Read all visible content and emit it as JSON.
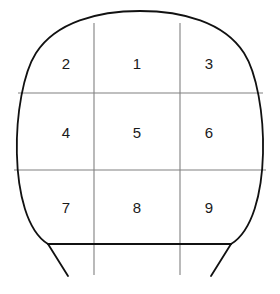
{
  "figure": {
    "shape_name": "dome-outline",
    "background_color": "#ffffff",
    "outline_color": "#111111",
    "grid_color": "#808080",
    "text_color": "#1a1a1a"
  },
  "grid": {
    "rows": 3,
    "columns": 3,
    "cells": [
      {
        "id": "cell-r1c1",
        "label": "2",
        "row": 1,
        "col": 1,
        "x": 66,
        "y": 63
      },
      {
        "id": "cell-r1c2",
        "label": "1",
        "row": 1,
        "col": 2,
        "x": 137,
        "y": 63
      },
      {
        "id": "cell-r1c3",
        "label": "3",
        "row": 1,
        "col": 3,
        "x": 209,
        "y": 63
      },
      {
        "id": "cell-r2c1",
        "label": "4",
        "row": 2,
        "col": 1,
        "x": 66,
        "y": 132
      },
      {
        "id": "cell-r2c2",
        "label": "5",
        "row": 2,
        "col": 2,
        "x": 137,
        "y": 132
      },
      {
        "id": "cell-r2c3",
        "label": "6",
        "row": 2,
        "col": 3,
        "x": 209,
        "y": 132
      },
      {
        "id": "cell-r3c1",
        "label": "7",
        "row": 3,
        "col": 1,
        "x": 66,
        "y": 207
      },
      {
        "id": "cell-r3c2",
        "label": "8",
        "row": 3,
        "col": 2,
        "x": 137,
        "y": 207
      },
      {
        "id": "cell-r3c3",
        "label": "9",
        "row": 3,
        "col": 3,
        "x": 209,
        "y": 207
      }
    ],
    "vertical_lines": [
      {
        "id": "grid-line-v1",
        "x": 94,
        "y1": 23,
        "y2": 275
      },
      {
        "id": "grid-line-v2",
        "x": 180,
        "y1": 23,
        "y2": 275
      }
    ],
    "horizontal_lines": [
      {
        "id": "grid-line-h1",
        "y": 93,
        "x1": 18,
        "x2": 263
      },
      {
        "id": "grid-line-h2",
        "y": 170,
        "x1": 14,
        "x2": 266
      }
    ],
    "baseline": {
      "id": "baseline",
      "y": 244,
      "x1": 48,
      "x2": 231
    }
  },
  "outline": {
    "arc_path": "M 48 244 C 6 218 11 92 36 53 C 56 22 98 11 140 11 C 182 11 224 22 244 53 C 269 92 274 218 231 244",
    "left_taper": {
      "id": "left-taper",
      "x1": 48,
      "y1": 244,
      "x2": 68,
      "y2": 276
    },
    "right_taper": {
      "id": "right-taper",
      "x1": 231,
      "y1": 244,
      "x2": 211,
      "y2": 276
    }
  }
}
